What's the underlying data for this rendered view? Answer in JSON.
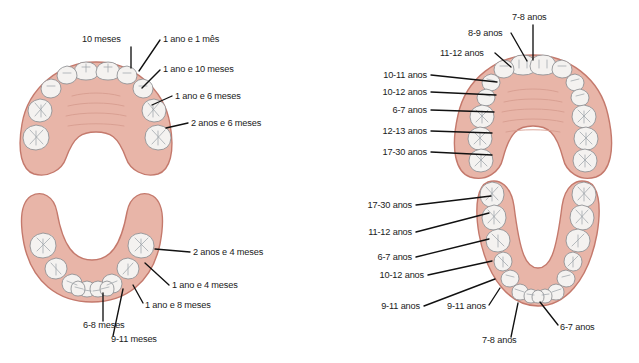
{
  "figure": {
    "colors": {
      "gum_fill": "#e8b5a8",
      "gum_stroke": "#c4796c",
      "tooth_fill": "#f4f2f0",
      "tooth_stroke": "#8d8f92",
      "label_text": "#1a1a1a",
      "leader_line": "#111111",
      "background": "#ffffff"
    },
    "panels": [
      {
        "id": "upper-primary",
        "name": "upper-primary-arch",
        "arch": "upper",
        "dentition": "primary",
        "teeth_count": 10,
        "labels": [
          {
            "text": "10 meses",
            "x": 82,
            "y": 42,
            "anchor": "start",
            "leader": "M 131 47 L 131 68"
          },
          {
            "text": "1 ano e 1 mês",
            "x": 163,
            "y": 42,
            "anchor": "start",
            "leader": "M 160 40 L 139 71"
          },
          {
            "text": "1 ano e 10 meses",
            "x": 163,
            "y": 72,
            "anchor": "start",
            "leader": "M 160 70 L 142 88"
          },
          {
            "text": "1 ano e 6 meses",
            "x": 175,
            "y": 99,
            "anchor": "start",
            "leader": "M 172 96 L 152 105"
          },
          {
            "text": "2 anos e 6 meses",
            "x": 191,
            "y": 126,
            "anchor": "start",
            "leader": "M 188 123 L 166 128"
          }
        ]
      },
      {
        "id": "lower-primary",
        "name": "lower-primary-arch",
        "arch": "lower",
        "dentition": "primary",
        "teeth_count": 10,
        "labels": [
          {
            "text": "2 anos e 4 meses",
            "x": 193,
            "y": 255,
            "anchor": "start",
            "leader": "M 190 252 L 155 249"
          },
          {
            "text": "1 ano e 4 meses",
            "x": 172,
            "y": 288,
            "anchor": "start",
            "leader": "M 169 285 L 145 263"
          },
          {
            "text": "1 ano e 8 meses",
            "x": 145,
            "y": 308,
            "anchor": "start",
            "leader": "M 143 303 L 133 285"
          },
          {
            "text": "6-8 meses",
            "x": 83,
            "y": 328,
            "anchor": "start",
            "leader": "M 103 321 L 103 293"
          },
          {
            "text": "9-11 meses",
            "x": 111,
            "y": 342,
            "anchor": "start",
            "leader": "M 113 336 L 123 289"
          }
        ]
      },
      {
        "id": "upper-permanent",
        "name": "upper-permanent-arch",
        "arch": "upper",
        "dentition": "permanent",
        "teeth_count": 16,
        "labels": [
          {
            "text": "7-8 anos",
            "x": 512,
            "y": 20,
            "anchor": "start",
            "leader": "M 533 25 L 533 60"
          },
          {
            "text": "8-9 anos",
            "x": 468,
            "y": 36,
            "anchor": "start",
            "leader": "M 511 33 L 527 61"
          },
          {
            "text": "11-12 anos",
            "x": 440,
            "y": 56,
            "anchor": "start",
            "leader": "M 495 53 L 511 67"
          },
          {
            "text": "10-11 anos",
            "x": 427,
            "y": 78,
            "anchor": "end",
            "leader": "M 431 75 L 497 82"
          },
          {
            "text": "10-12 anos",
            "x": 427,
            "y": 95,
            "anchor": "end",
            "leader": "M 431 92 L 496 95"
          },
          {
            "text": "6-7 anos",
            "x": 427,
            "y": 113,
            "anchor": "end",
            "leader": "M 431 110 L 494 112"
          },
          {
            "text": "12-13 anos",
            "x": 427,
            "y": 134,
            "anchor": "end",
            "leader": "M 431 131 L 492 133"
          },
          {
            "text": "17-30 anos",
            "x": 427,
            "y": 155,
            "anchor": "end",
            "leader": "M 431 152 L 492 155"
          }
        ]
      },
      {
        "id": "lower-permanent",
        "name": "lower-permanent-arch",
        "arch": "lower",
        "dentition": "permanent",
        "teeth_count": 16,
        "labels": [
          {
            "text": "17-30 anos",
            "x": 412,
            "y": 208,
            "anchor": "end",
            "leader": "M 416 205 L 491 196"
          },
          {
            "text": "11-12 anos",
            "x": 412,
            "y": 235,
            "anchor": "end",
            "leader": "M 416 232 L 489 213"
          },
          {
            "text": "6-7 anos",
            "x": 412,
            "y": 260,
            "anchor": "end",
            "leader": "M 416 257 L 489 239"
          },
          {
            "text": "10-12 anos",
            "x": 424,
            "y": 278,
            "anchor": "end",
            "leader": "M 428 275 L 492 261"
          },
          {
            "text": "9-11 anos",
            "x": 420,
            "y": 309,
            "anchor": "end",
            "leader": "M 424 306 L 495 279"
          },
          {
            "text": "9-11 anos",
            "x": 447,
            "y": 309,
            "anchor": "start",
            "leader": "M 489 305 L 500 288"
          },
          {
            "text": "7-8 anos",
            "x": 482,
            "y": 343,
            "anchor": "start",
            "leader": "M 511 337 L 518 303"
          },
          {
            "text": "6-7 anos",
            "x": 560,
            "y": 330,
            "anchor": "start",
            "leader": "M 558 325 L 540 302"
          }
        ]
      }
    ]
  }
}
